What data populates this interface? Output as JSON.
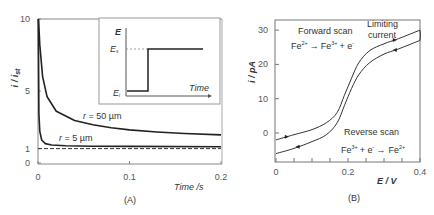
{
  "chart_data": [
    {
      "panel": "(A)",
      "type": "line",
      "title": "",
      "xlabel": "Time /s",
      "ylabel": "i / i_st",
      "xlim": [
        0,
        0.2
      ],
      "ylim": [
        0,
        10
      ],
      "xticks": [
        "0",
        "0.1",
        "0.2"
      ],
      "yticks": [
        "0",
        "1",
        "5",
        "10"
      ],
      "grid": false,
      "series": [
        {
          "name": "r = 50 µm",
          "x": [
            0.0005,
            0.002,
            0.005,
            0.01,
            0.02,
            0.04,
            0.06,
            0.08,
            0.1,
            0.13,
            0.16,
            0.2
          ],
          "y": [
            10,
            8.2,
            6.0,
            4.6,
            3.6,
            2.95,
            2.65,
            2.45,
            2.3,
            2.15,
            2.05,
            1.95
          ]
        },
        {
          "name": "r = 5 µm",
          "x": [
            0.0003,
            0.001,
            0.002,
            0.004,
            0.008,
            0.015,
            0.03,
            0.06,
            0.1,
            0.2
          ],
          "y": [
            10,
            3.4,
            2.2,
            1.6,
            1.35,
            1.25,
            1.2,
            1.17,
            1.15,
            1.13
          ]
        },
        {
          "name": "steady state",
          "style": "dashed",
          "x": [
            0,
            0.2
          ],
          "y": [
            1,
            1
          ]
        }
      ],
      "annotations": [
        "r = 50 µm",
        "r = 5 µm"
      ],
      "inset": {
        "ylabel": "E",
        "xlabel": "Time",
        "levels": [
          "E_i",
          "E_s"
        ],
        "description": "potential step from E_i to E_s"
      }
    },
    {
      "panel": "(B)",
      "type": "line",
      "title": "",
      "xlabel": "E / V",
      "ylabel": "i / pA",
      "xlim": [
        0,
        0.4
      ],
      "ylim": [
        -8,
        32
      ],
      "xticks": [
        "0",
        "0.2",
        "0.4"
      ],
      "yticks": [
        "0",
        "10",
        "20",
        "30"
      ],
      "grid": false,
      "series": [
        {
          "name": "Forward scan",
          "x": [
            0,
            0.05,
            0.1,
            0.14,
            0.17,
            0.19,
            0.21,
            0.23,
            0.26,
            0.3,
            0.34,
            0.4
          ],
          "y": [
            -2,
            -0.5,
            1,
            3,
            6,
            11,
            16,
            20.5,
            24,
            26,
            27.5,
            30
          ]
        },
        {
          "name": "Reverse scan",
          "x": [
            0.4,
            0.34,
            0.3,
            0.26,
            0.23,
            0.21,
            0.19,
            0.17,
            0.14,
            0.1,
            0.05,
            0
          ],
          "y": [
            27,
            24.5,
            23,
            20.5,
            17,
            13,
            8,
            3,
            -0.5,
            -2.5,
            -4.5,
            -6
          ]
        }
      ],
      "annotations": [
        "Forward scan",
        "Fe2+ → Fe3+ + e-",
        "Limiting current",
        "Reverse scan",
        "Fe3+ + e- → Fe2+"
      ]
    }
  ],
  "panelA": {
    "ylabel_main": "i / i",
    "ylabel_sub": "st",
    "yticks": [
      {
        "v": 10,
        "t": "10"
      },
      {
        "v": 5,
        "t": "5"
      },
      {
        "v": 1,
        "t": "1"
      },
      {
        "v": 0,
        "t": "0"
      }
    ],
    "xticks": [
      {
        "v": 0,
        "t": "0"
      },
      {
        "v": 0.1,
        "t": "0.1"
      },
      {
        "v": 0.2,
        "t": "0.2"
      }
    ],
    "xlabel": "Time /s",
    "label_r50": "r = 50 µm",
    "label_r5": "r = 5 µm",
    "caption": "(A)",
    "inset": {
      "E": "E",
      "Es": "E",
      "Es_sub": "s",
      "Ei": "E",
      "Ei_sub": "i",
      "time": "Time"
    }
  },
  "panelB": {
    "ylabel": "i / pA",
    "xlabel": "E / V",
    "yticks": [
      {
        "v": 30,
        "t": "30"
      },
      {
        "v": 20,
        "t": "20"
      },
      {
        "v": 10,
        "t": "10"
      },
      {
        "v": 0,
        "t": "0"
      }
    ],
    "xticks": [
      {
        "v": 0,
        "t": "0"
      },
      {
        "v": 0.2,
        "t": "0.2"
      },
      {
        "v": 0.4,
        "t": "0.4"
      }
    ],
    "forward_title": "Forward scan",
    "forward_eq": {
      "a": "Fe",
      "a_sup": "2+",
      "arrow": "→",
      "b": "Fe",
      "b_sup": "3+",
      "c": "+ e",
      "c_sup": "-"
    },
    "limiting_1": "Limiting",
    "limiting_2": "current",
    "reverse_title": "Reverse scan",
    "reverse_eq": {
      "a": "Fe",
      "a_sup": "3+",
      "b": "+ e",
      "b_sup": "-",
      "arrow": "→",
      "c": "Fe",
      "c_sup": "2+"
    },
    "caption": "(B)"
  }
}
